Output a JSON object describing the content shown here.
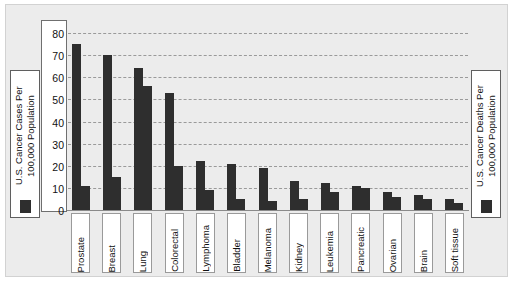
{
  "chart_data": {
    "type": "bar",
    "title": "",
    "subtitle": "",
    "xlabel": "",
    "ylabel": "",
    "ylim": [
      0,
      85
    ],
    "yticks": [
      0,
      10,
      20,
      30,
      40,
      50,
      60,
      70,
      80
    ],
    "grid": true,
    "legend_position": "left-and-right-outside",
    "categories": [
      "Prostate",
      "Breast",
      "Lung",
      "Colorectal",
      "Lymphoma",
      "Bladder",
      "Melanoma",
      "Kidney",
      "Leukemia",
      "Pancreatic",
      "Ovarian",
      "Brain",
      "Soft tissue"
    ],
    "series": [
      {
        "name": "U.S. Cancer Cases Per 100,000 Population",
        "color": "#2e2e2e",
        "values": [
          75,
          70,
          64,
          53,
          22,
          21,
          19,
          13,
          12,
          11,
          8,
          7,
          5
        ]
      },
      {
        "name": "U.S. Cancer Deaths Per 100,000 Population",
        "color": "#2e2e2e",
        "values": [
          11,
          15,
          56,
          20,
          9,
          5,
          4,
          5,
          8,
          10,
          6,
          5,
          3
        ]
      }
    ]
  },
  "legend_left": {
    "label": "U.S. Cancer Cases Per\n100,000 Population",
    "swatch_color": "#2e2e2e",
    "swatch_icon": "filled-square-icon"
  },
  "legend_right": {
    "label": "U.S. Cancer Deaths Per\n100,000 Population",
    "swatch_color": "#2e2e2e",
    "swatch_icon": "filled-square-icon"
  },
  "colors": {
    "bar": "#2e2e2e",
    "plot_background": "#ececec",
    "panel_background": "#ececec",
    "gridline": "#9a9a9a",
    "axis": "#8a8a8a",
    "card_background": "#ffffff",
    "text": "#111111"
  }
}
